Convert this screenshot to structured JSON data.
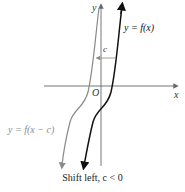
{
  "figure": {
    "axes": {
      "x_label": "x",
      "y_label": "y",
      "origin_label": "O"
    },
    "curves": [
      {
        "name": "original",
        "label": "y = f(x)",
        "color": "#111111"
      },
      {
        "name": "shifted",
        "label": "y = f(x − c)",
        "color": "#8a8a8a"
      }
    ],
    "shift_label": "c",
    "caption": "Shift left, c < 0"
  }
}
